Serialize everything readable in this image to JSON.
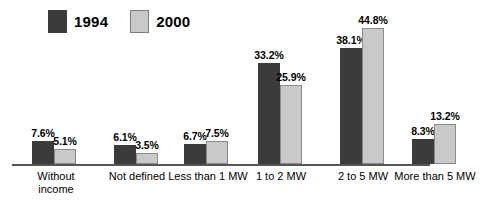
{
  "legend": {
    "entries": [
      {
        "label": "1994",
        "color": "#3b3b3b",
        "swatch_name": "legend-swatch-1994"
      },
      {
        "label": "2000",
        "color": "#c9c9c9",
        "swatch_name": "legend-swatch-2000"
      }
    ]
  },
  "chart_data": {
    "type": "bar",
    "title": "",
    "subtitle": "",
    "xlabel": "",
    "ylabel": "",
    "ylim": [
      0,
      44.8
    ],
    "grid": false,
    "legend_position": "top-left",
    "categories": [
      "Without\nincome",
      "Not defined",
      "Less than 1 MW",
      "1 to 2 MW",
      "2 to 5 MW",
      "More than 5 MW"
    ],
    "series": [
      {
        "name": "1994",
        "color": "#3b3b3b",
        "values": [
          7.6,
          6.1,
          6.7,
          33.2,
          38.1,
          8.3
        ],
        "labels": [
          "7.6%",
          "6.1%",
          "6.7%",
          "33.2%",
          "38.1%",
          "8.3%"
        ]
      },
      {
        "name": "2000",
        "color": "#c9c9c9",
        "values": [
          5.1,
          3.5,
          7.5,
          25.9,
          44.8,
          13.2
        ],
        "labels": [
          "5.1%",
          "3.5%",
          "7.5%",
          "25.9%",
          "44.8%",
          "13.2%"
        ]
      }
    ]
  },
  "axis": {
    "baseline_color": "#555555"
  }
}
